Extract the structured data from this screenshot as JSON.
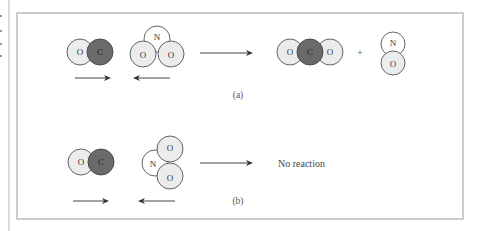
{
  "figure": {
    "panel_a": {
      "caption": "(a)",
      "reactant_1": {
        "formula": "CO",
        "atoms": [
          "O",
          "C"
        ]
      },
      "reactant_2": {
        "formula": "NO2",
        "atoms": [
          "N",
          "O",
          "O"
        ]
      },
      "product_1": {
        "formula": "CO2",
        "atoms": [
          "O",
          "C",
          "O"
        ]
      },
      "plus": "+",
      "product_2": {
        "formula": "NO",
        "atoms": [
          "N",
          "O"
        ]
      }
    },
    "panel_b": {
      "caption": "(b)",
      "reactant_1": {
        "formula": "CO",
        "atoms": [
          "O",
          "C"
        ]
      },
      "reactant_2": {
        "formula": "NO2",
        "atoms": [
          "N",
          "O",
          "O"
        ]
      },
      "result_text": "No reaction"
    },
    "colors": {
      "carbon_fill": "#6a6a6a",
      "oxygen_fill": "#ececec",
      "nitrogen_fill": "#ffffff",
      "frame": "#9a9a9a"
    }
  }
}
